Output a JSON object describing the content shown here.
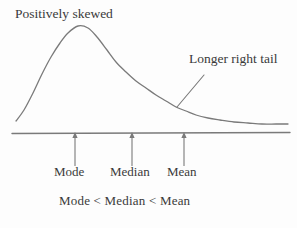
{
  "figure": {
    "title_label": "Positively skewed",
    "tail_label": "Longer right tail",
    "inequality_label": "Mode  < Median < Mean",
    "line_color": "#7a7a7a",
    "text_color": "#3a3a3a",
    "background": "#fdfdfd",
    "ticks": [
      {
        "name": "mode",
        "label": "Mode",
        "x": 75
      },
      {
        "name": "median",
        "label": "Median",
        "x": 132
      },
      {
        "name": "mean",
        "label": "Mean",
        "x": 184
      }
    ]
  },
  "chart_data": {
    "type": "line",
    "title": "Positively skewed",
    "xlabel": "",
    "ylabel": "",
    "grid": false,
    "legend": null,
    "annotations": [
      {
        "text": "Positively skewed",
        "x": 15,
        "y": 6
      },
      {
        "text": "Longer right tail",
        "x": 189,
        "y": 51,
        "pointer_from": [
          204,
          75
        ],
        "pointer_to": [
          177,
          107
        ]
      }
    ],
    "axis_line": {
      "x_start": 12,
      "x_end": 290,
      "y": 133
    },
    "markers": [
      {
        "label": "Mode",
        "x": 75,
        "arrow_from_y": 166,
        "arrow_to_y": 136
      },
      {
        "label": "Median",
        "x": 132,
        "arrow_from_y": 166,
        "arrow_to_y": 136
      },
      {
        "label": "Mean",
        "x": 184,
        "arrow_from_y": 166,
        "arrow_to_y": 136
      }
    ],
    "ordering": "Mode  < Median < Mean",
    "curve_description": "Right-skewed (positively skewed) unimodal density curve with mode left of median left of mean and a long right tail",
    "curve_points": [
      [
        16,
        121
      ],
      [
        24,
        110
      ],
      [
        33,
        93
      ],
      [
        42,
        74
      ],
      [
        51,
        57
      ],
      [
        60,
        43
      ],
      [
        68,
        33
      ],
      [
        78,
        26
      ],
      [
        88,
        28
      ],
      [
        97,
        37
      ],
      [
        107,
        50
      ],
      [
        116,
        62
      ],
      [
        126,
        72
      ],
      [
        136,
        81
      ],
      [
        146,
        88
      ],
      [
        156,
        95
      ],
      [
        166,
        101
      ],
      [
        176,
        107
      ],
      [
        186,
        111
      ],
      [
        196,
        115
      ],
      [
        208,
        118
      ],
      [
        220,
        120
      ],
      [
        234,
        122
      ],
      [
        248,
        123
      ],
      [
        262,
        124
      ],
      [
        276,
        124
      ],
      [
        288,
        124
      ]
    ]
  }
}
